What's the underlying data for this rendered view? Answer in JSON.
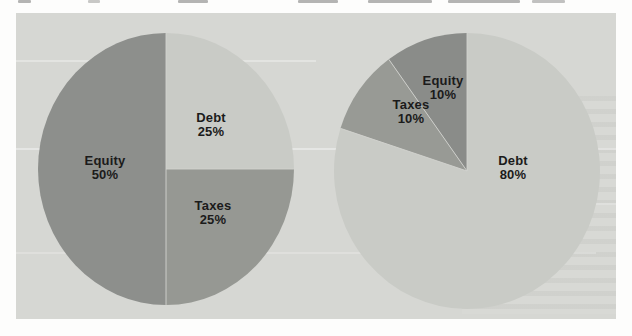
{
  "page": {
    "background": "#fdfdfc",
    "panel_background": "#d6d7d3",
    "label_color": "#1b1b1b",
    "divider_color": "#d2d3cf"
  },
  "chart_data": [
    {
      "type": "pie",
      "name": "capital-structure-pie-left",
      "title": "",
      "direction": "clockwise",
      "start_angle_deg": 0,
      "center_x": 166,
      "center_y": 169,
      "radius_x": 128,
      "radius_y": 136,
      "slices": [
        {
          "label": "Debt",
          "pct": 25,
          "color": "#c9cbc6",
          "label_x": 211,
          "label_y": 122
        },
        {
          "label": "Taxes",
          "pct": 25,
          "color": "#969893",
          "label_x": 213,
          "label_y": 210
        },
        {
          "label": "Equity",
          "pct": 50,
          "color": "#8d8f8c",
          "label_x": 105,
          "label_y": 165
        }
      ]
    },
    {
      "type": "pie",
      "name": "capital-structure-pie-right",
      "title": "",
      "direction": "clockwise",
      "start_angle_deg": 0,
      "center_x": 467,
      "center_y": 171,
      "radius_x": 133,
      "radius_y": 138,
      "slices": [
        {
          "label": "Debt",
          "pct": 80,
          "color": "#c9cbc6",
          "label_x": 513,
          "label_y": 165
        },
        {
          "label": "Taxes",
          "pct": 10,
          "color": "#989a95",
          "label_x": 411,
          "label_y": 109
        },
        {
          "label": "Equity",
          "pct": 10,
          "color": "#8a8c89",
          "label_x": 443,
          "label_y": 85
        }
      ]
    }
  ]
}
